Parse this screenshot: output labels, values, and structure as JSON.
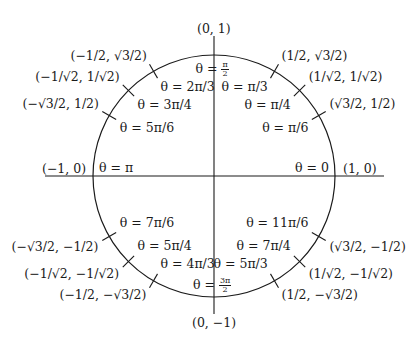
{
  "diagram": {
    "axis_labels": {
      "top": "(0, 1)",
      "bottom": "(0, −1)",
      "left": "(−1, 0)",
      "right": "(1, 0)"
    },
    "points": [
      {
        "angle_deg": 0,
        "theta": "θ = 0",
        "coord": "(1, 0)"
      },
      {
        "angle_deg": 30,
        "theta": "θ = π/6",
        "coord": "(√3/2, 1/2)"
      },
      {
        "angle_deg": 45,
        "theta": "θ = π/4",
        "coord": "(1/√2, 1/√2)"
      },
      {
        "angle_deg": 60,
        "theta": "θ = π/3",
        "coord": "(1/2, √3/2)"
      },
      {
        "angle_deg": 90,
        "theta_prefix": "θ =",
        "theta_num": "π",
        "theta_den": "2",
        "coord": "(0, 1)"
      },
      {
        "angle_deg": 120,
        "theta": "θ = 2π/3",
        "coord": "(−1/2, √3/2)"
      },
      {
        "angle_deg": 135,
        "theta": "θ = 3π/4",
        "coord": "(−1/√2, 1/√2)"
      },
      {
        "angle_deg": 150,
        "theta": "θ = 5π/6",
        "coord": "(−√3/2, 1/2)"
      },
      {
        "angle_deg": 180,
        "theta": "θ = π",
        "coord": "(−1, 0)"
      },
      {
        "angle_deg": 210,
        "theta": "θ = 7π/6",
        "coord": "(−√3/2, −1/2)"
      },
      {
        "angle_deg": 225,
        "theta": "θ = 5π/4",
        "coord": "(−1/√2, −1/√2)"
      },
      {
        "angle_deg": 240,
        "theta": "θ = 4π/3",
        "coord": "(−1/2, −√3/2)"
      },
      {
        "angle_deg": 270,
        "theta_prefix": "θ =",
        "theta_num": "3π",
        "theta_den": "2",
        "coord": "(0, −1)"
      },
      {
        "angle_deg": 300,
        "theta": "θ = 5π/3",
        "coord": "(1/2, −√3/2)"
      },
      {
        "angle_deg": 315,
        "theta": "θ = 7π/4",
        "coord": "(1/√2, −1/√2)"
      },
      {
        "angle_deg": 330,
        "theta": "θ = 11π/6",
        "coord": "(√3/2, −1/2)"
      }
    ]
  }
}
